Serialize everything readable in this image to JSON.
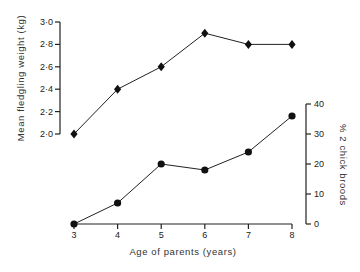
{
  "chart_data": {
    "type": "line",
    "title": "",
    "xlabel": "Age of parents (years)",
    "x": [
      3,
      4,
      5,
      6,
      7,
      8
    ],
    "series": [
      {
        "name": "Mean fledgling weight (kg)",
        "axis": "left",
        "marker": "diamond",
        "values": [
          2.0,
          2.4,
          2.6,
          2.9,
          2.8,
          2.8
        ]
      },
      {
        "name": "% 2 chick broods",
        "axis": "right",
        "marker": "circle",
        "values": [
          0,
          7,
          20,
          18,
          24,
          36
        ]
      }
    ],
    "ylabel_left": "Mean fledgling weight (kg)",
    "ylim_left": [
      2.0,
      3.0
    ],
    "yticks_left": [
      "2·0",
      "2·2",
      "2·4",
      "2·6",
      "2·8",
      "3·0"
    ],
    "ylabel_right": "% 2 chick broods",
    "ylim_right": [
      0,
      40
    ],
    "yticks_right": [
      "0",
      "10",
      "20",
      "30",
      "40"
    ],
    "xticks": [
      "3",
      "4",
      "5",
      "6",
      "7",
      "8"
    ],
    "grid": false,
    "legend": "none"
  }
}
